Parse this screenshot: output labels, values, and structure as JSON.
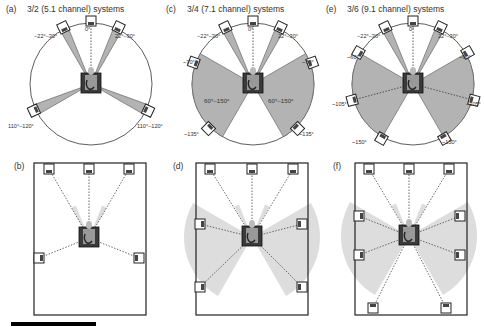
{
  "panels": [
    {
      "id": "a",
      "tag": "(a)",
      "title": "3/2 (5.1 channel) systems",
      "type": "circle",
      "labels": {
        "center": "0°",
        "fl": "−22°–30°",
        "fr": "22°–30°",
        "sl": "110°–120°",
        "sr": "110°–120°"
      }
    },
    {
      "id": "c",
      "tag": "(c)",
      "title": "3/4 (7.1 channel) systems",
      "type": "circle",
      "labels": {
        "center": "0°",
        "fl": "−22°–30°",
        "fr": "22°–30°",
        "sl": "~70°",
        "sr": "~70°",
        "bl": "~135°",
        "br": "~135°",
        "zl": "60°–150°",
        "zr": "60°–150°"
      }
    },
    {
      "id": "e",
      "tag": "(e)",
      "title": "3/6 (9.1 channel) systems",
      "type": "circle",
      "labels": {
        "center": "0°",
        "fl": "−22°–30°",
        "fr": "22°–30°",
        "sl": "~60°",
        "sr": "~60°",
        "ml": "~105°",
        "mr": "~105°",
        "bl": "~150°",
        "br": "~150°"
      }
    },
    {
      "id": "b",
      "tag": "(b)",
      "type": "room"
    },
    {
      "id": "d",
      "tag": "(d)",
      "type": "room"
    },
    {
      "id": "f",
      "tag": "(f)",
      "type": "room"
    }
  ],
  "colors": {
    "zone": "#b3b3b3",
    "zone_light": "#dddddd",
    "line": "#333333"
  }
}
